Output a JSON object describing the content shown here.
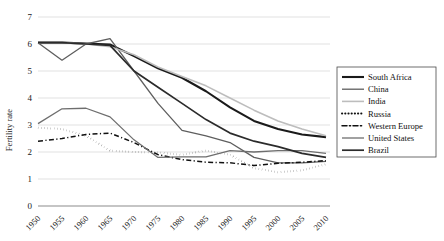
{
  "chart_data": {
    "type": "line",
    "title": "",
    "xlabel": "",
    "ylabel": "Fertility rate",
    "xlim": [
      1950,
      2010
    ],
    "ylim": [
      0,
      7
    ],
    "grid": true,
    "legend_position": "right",
    "categories": [
      1950,
      1955,
      1960,
      1965,
      1970,
      1975,
      1980,
      1985,
      1990,
      1995,
      2000,
      2005,
      2010
    ],
    "tick_labels_x": [
      "1950",
      "1955",
      "1960",
      "1965",
      "1970",
      "1975",
      "1980",
      "1985",
      "1990",
      "1995",
      "2000",
      "2005",
      "2010"
    ],
    "tick_labels_y": [
      "0",
      "1",
      "2",
      "3",
      "4",
      "5",
      "6",
      "7"
    ],
    "series": [
      {
        "name": "South Africa",
        "color": "#1a1a1a",
        "width": 2.1,
        "dash": "",
        "values": [
          6.05,
          6.05,
          6.02,
          5.98,
          5.55,
          5.1,
          4.75,
          4.25,
          3.65,
          3.15,
          2.85,
          2.65,
          2.55
        ]
      },
      {
        "name": "China",
        "color": "#5e5e5e",
        "width": 1.3,
        "dash": "",
        "values": [
          6.05,
          5.4,
          6.0,
          6.2,
          5.0,
          3.8,
          2.8,
          2.6,
          2.35,
          1.8,
          1.6,
          1.6,
          1.65
        ]
      },
      {
        "name": "India",
        "color": "#bdbdbd",
        "width": 1.6,
        "dash": "",
        "values": [
          6.05,
          6.05,
          6.0,
          5.9,
          5.6,
          5.15,
          4.8,
          4.45,
          4.0,
          3.55,
          3.15,
          2.85,
          2.6
        ]
      },
      {
        "name": "Russia",
        "color": "#101010",
        "width": 2.0,
        "dash": "0.2,3.0",
        "values": [
          2.9,
          2.85,
          2.6,
          2.05,
          2.0,
          1.98,
          1.9,
          2.05,
          1.9,
          1.4,
          1.25,
          1.32,
          1.55
        ]
      },
      {
        "name": "Western Europe",
        "color": "#101010",
        "width": 1.5,
        "dash": "5,2.4,1.2,2.4",
        "values": [
          2.4,
          2.5,
          2.65,
          2.7,
          2.35,
          1.9,
          1.72,
          1.62,
          1.6,
          1.5,
          1.58,
          1.62,
          1.68
        ]
      },
      {
        "name": "United States",
        "color": "#6e6e6e",
        "width": 1.3,
        "dash": "",
        "values": [
          3.05,
          3.6,
          3.62,
          3.3,
          2.45,
          1.8,
          1.82,
          1.82,
          2.05,
          2.0,
          2.05,
          2.05,
          1.95
        ]
      },
      {
        "name": "Brazil",
        "color": "#2b2b2b",
        "width": 1.7,
        "dash": "",
        "values": [
          6.05,
          6.05,
          6.0,
          5.95,
          5.0,
          4.4,
          3.8,
          3.2,
          2.7,
          2.4,
          2.2,
          1.95,
          1.8
        ]
      }
    ]
  },
  "axis": {
    "y_title": "Fertility rate"
  }
}
